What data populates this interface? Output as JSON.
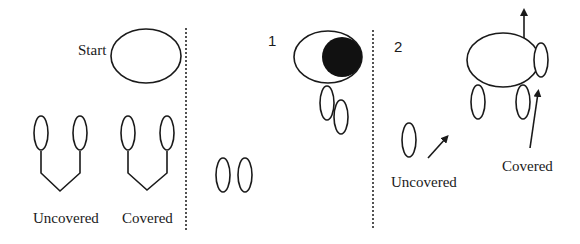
{
  "colors": {
    "stroke": "#1a1a1a",
    "fill_dark": "#111111",
    "background": "#ffffff"
  },
  "panels": [
    {
      "id": "legend",
      "start_label": "Start",
      "labels": [
        "Uncovered",
        "Covered"
      ]
    },
    {
      "id": "step1",
      "step_number": "1"
    },
    {
      "id": "step2",
      "step_number": "2",
      "labels": [
        "Uncovered",
        "Covered"
      ]
    }
  ],
  "icons": {
    "arrow_up": "arrow-up-icon",
    "arrow_diag": "arrow-diagonal-icon"
  }
}
